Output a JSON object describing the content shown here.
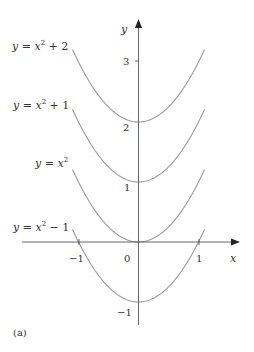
{
  "chart_data": {
    "type": "line",
    "title": "",
    "caption": "(a)",
    "xlabel": "x",
    "ylabel": "y",
    "x_ticks": [
      "−1",
      "0",
      "1"
    ],
    "x_tick_values": [
      -1,
      0,
      1
    ],
    "y_ticks": [
      "3",
      "2",
      "1",
      "−1"
    ],
    "y_tick_values": [
      3,
      2,
      1,
      -1
    ],
    "xlim": [
      -1.1,
      1.1
    ],
    "ylim": [
      -1,
      3.2
    ],
    "grid": false,
    "legend_position": "inline-left",
    "series": [
      {
        "name": "y = x^2 + 2",
        "label_base": "y = x",
        "label_sup": "2",
        "label_tail": " + 2",
        "shift": 2,
        "x": [
          -1.1,
          -1,
          -0.5,
          0,
          0.5,
          1,
          1.1
        ],
        "values": [
          3.21,
          3,
          2.25,
          2,
          2.25,
          3,
          3.21
        ]
      },
      {
        "name": "y = x^2 + 1",
        "label_base": "y = x",
        "label_sup": "2",
        "label_tail": " + 1",
        "shift": 1,
        "x": [
          -1.1,
          -1,
          -0.5,
          0,
          0.5,
          1,
          1.1
        ],
        "values": [
          2.21,
          2,
          1.25,
          1,
          1.25,
          2,
          2.21
        ]
      },
      {
        "name": "y = x^2",
        "label_base": "y = x",
        "label_sup": "2",
        "label_tail": "",
        "shift": 0,
        "x": [
          -1.1,
          -1,
          -0.5,
          0,
          0.5,
          1,
          1.1
        ],
        "values": [
          1.21,
          1,
          0.25,
          0,
          0.25,
          1,
          1.21
        ]
      },
      {
        "name": "y = x^2 − 1",
        "label_base": "y = x",
        "label_sup": "2",
        "label_tail": " − 1",
        "shift": -1,
        "x": [
          -1.1,
          -1,
          -0.5,
          0,
          0.5,
          1,
          1.1
        ],
        "values": [
          0.21,
          0,
          -0.75,
          -1,
          -0.75,
          0,
          0.21
        ]
      }
    ]
  },
  "colors": {
    "curve": "#9a9a9a",
    "axis": "#555555",
    "text": "#333333"
  }
}
